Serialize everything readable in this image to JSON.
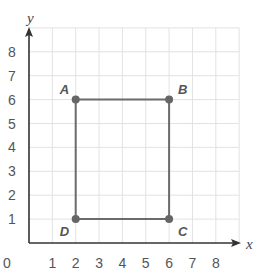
{
  "chart_data": {
    "type": "scatter",
    "title": "",
    "xlabel": "x",
    "ylabel": "y",
    "xlim": [
      0,
      9
    ],
    "ylim": [
      0,
      9
    ],
    "grid": true,
    "x_ticks": [
      "1",
      "2",
      "3",
      "4",
      "5",
      "6",
      "7",
      "8"
    ],
    "y_ticks": [
      "1",
      "2",
      "3",
      "4",
      "5",
      "6",
      "7",
      "8"
    ],
    "origin_label": "0",
    "points": [
      {
        "label": "A",
        "x": 2,
        "y": 6
      },
      {
        "label": "B",
        "x": 6,
        "y": 6
      },
      {
        "label": "C",
        "x": 6,
        "y": 1
      },
      {
        "label": "D",
        "x": 2,
        "y": 1
      }
    ],
    "polygon": [
      "A",
      "B",
      "C",
      "D"
    ],
    "shape": "rectangle ABCD"
  },
  "colors": {
    "grid": "#e2e2e2",
    "axis": "#333333",
    "shape": "#6b6b6b",
    "point": "#666666",
    "text": "#555555"
  }
}
